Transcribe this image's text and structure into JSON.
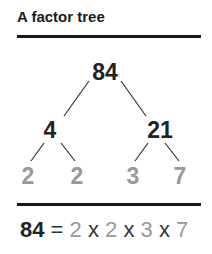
{
  "title": "A factor tree",
  "tree": {
    "root": "84",
    "level1": [
      "4",
      "21"
    ],
    "leaves": [
      "2",
      "2",
      "3",
      "7"
    ]
  },
  "equation": {
    "lhs": "84",
    "equals": "=",
    "factors": [
      "2",
      "2",
      "3",
      "7"
    ],
    "times": "x"
  },
  "colors": {
    "dark": "#222222",
    "prime": "#999999"
  }
}
